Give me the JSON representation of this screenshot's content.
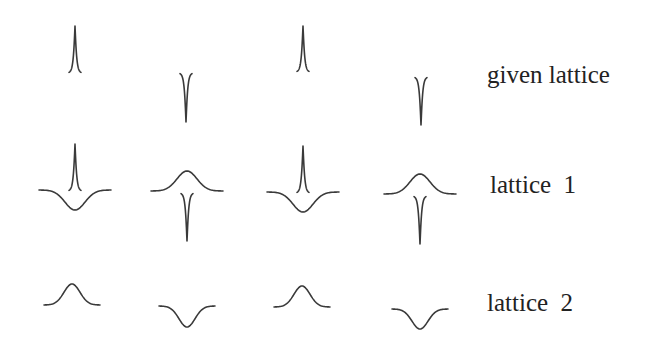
{
  "figure": {
    "rows": [
      {
        "label": "given lattice",
        "label_pos": {
          "x": 487,
          "y": 62
        },
        "sites": [
          {
            "cx": 75,
            "type": "narrow-peak",
            "baseline": 73,
            "extent": 47
          },
          {
            "cx": 186,
            "type": "narrow-dip",
            "baseline": 73,
            "extent": 49
          },
          {
            "cx": 303,
            "type": "narrow-peak",
            "baseline": 72,
            "extent": 46
          },
          {
            "cx": 421,
            "type": "narrow-dip",
            "baseline": 77,
            "extent": 48
          }
        ]
      },
      {
        "label": "lattice  1",
        "label_pos": {
          "x": 490,
          "y": 172
        },
        "sites": [
          {
            "cx": 75,
            "type": "wide-dip+narrow-peak",
            "baseline": 190,
            "wide_extent": 20,
            "narrow_extent": 47
          },
          {
            "cx": 187,
            "type": "wide-bump+narrow-dip",
            "baseline": 191,
            "wide_extent": 20,
            "narrow_extent": 48
          },
          {
            "cx": 303,
            "type": "wide-dip+narrow-peak",
            "baseline": 192,
            "wide_extent": 20,
            "narrow_extent": 47
          },
          {
            "cx": 420,
            "type": "wide-bump+narrow-dip",
            "baseline": 194,
            "wide_extent": 20,
            "narrow_extent": 48
          }
        ]
      },
      {
        "label": "lattice  2",
        "label_pos": {
          "x": 487,
          "y": 290
        },
        "sites": [
          {
            "cx": 72,
            "type": "wide-bump",
            "baseline": 305,
            "extent": 21
          },
          {
            "cx": 187,
            "type": "wide-dip",
            "baseline": 306,
            "extent": 21
          },
          {
            "cx": 302,
            "type": "wide-bump",
            "baseline": 307,
            "extent": 21
          },
          {
            "cx": 420,
            "type": "wide-dip",
            "baseline": 309,
            "extent": 20
          }
        ]
      }
    ],
    "stroke_color": "#3a3a3a",
    "text_color": "#222222"
  }
}
